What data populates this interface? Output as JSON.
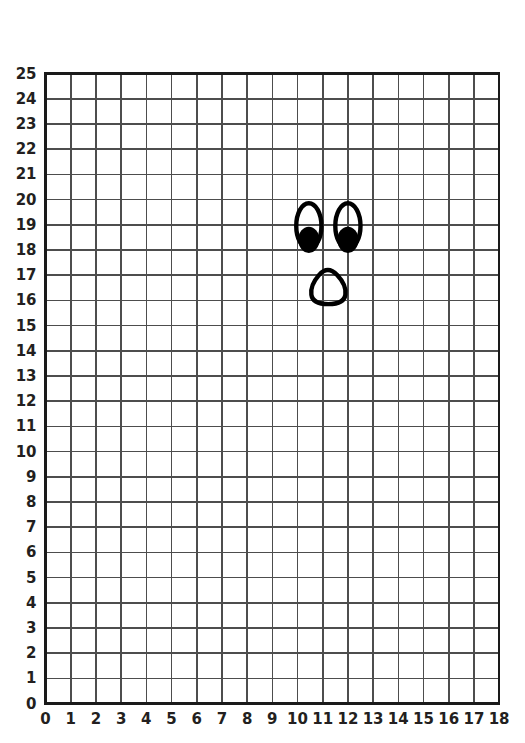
{
  "page": {
    "background_color": "#ffffff"
  },
  "chart_data": {
    "type": "scatter",
    "title": "",
    "xlabel": "",
    "ylabel": "",
    "xlim": [
      0,
      18
    ],
    "ylim": [
      0,
      25
    ],
    "grid": true,
    "grid_step": 1,
    "legend": "none",
    "x_tick_labels": [
      "0",
      "1",
      "2",
      "3",
      "4",
      "5",
      "6",
      "7",
      "8",
      "9",
      "10",
      "11",
      "12",
      "13",
      "14",
      "15",
      "16",
      "17",
      "18"
    ],
    "y_tick_labels": [
      "0",
      "1",
      "2",
      "3",
      "4",
      "5",
      "6",
      "7",
      "8",
      "9",
      "10",
      "11",
      "12",
      "13",
      "14",
      "15",
      "16",
      "17",
      "18",
      "19",
      "20",
      "21",
      "22",
      "23",
      "24",
      "25"
    ],
    "annotations": [
      {
        "name": "left-eye-outline",
        "shape": "ellipse",
        "center_x": 10.45,
        "center_y": 18.95,
        "radius_x": 0.5,
        "radius_y": 0.9,
        "stroke": "#000000",
        "fill": "none"
      },
      {
        "name": "left-eye-pupil",
        "shape": "ellipse",
        "center_x": 10.45,
        "center_y": 18.4,
        "radius_x": 0.42,
        "radius_y": 0.52,
        "stroke": "none",
        "fill": "#000000"
      },
      {
        "name": "right-eye-outline",
        "shape": "ellipse",
        "center_x": 12.0,
        "center_y": 18.95,
        "radius_x": 0.5,
        "radius_y": 0.9,
        "stroke": "#000000",
        "fill": "none"
      },
      {
        "name": "right-eye-pupil",
        "shape": "ellipse",
        "center_x": 12.0,
        "center_y": 18.4,
        "radius_x": 0.42,
        "radius_y": 0.52,
        "stroke": "none",
        "fill": "#000000"
      },
      {
        "name": "nose-outline",
        "shape": "rounded-pentagon",
        "points": [
          [
            11.2,
            17.4
          ],
          [
            11.95,
            16.6
          ],
          [
            11.85,
            15.85
          ],
          [
            10.6,
            15.85
          ],
          [
            10.5,
            16.6
          ]
        ],
        "stroke": "#000000",
        "fill": "none"
      }
    ]
  },
  "style": {
    "grid_line_color": "#4d4d4d",
    "border_color": "#1a1a1a",
    "label_color": "#231f20",
    "drawing_color": "#000000"
  }
}
